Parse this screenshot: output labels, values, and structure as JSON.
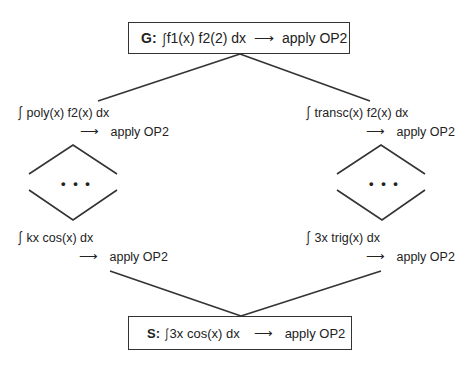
{
  "goal": {
    "prefix": "G:",
    "integral_symbol": "∫",
    "expression": "f1(x) f2(2) dx",
    "arrow": "⟶",
    "action": "apply OP2"
  },
  "left_branch": {
    "top": {
      "integral_symbol": "∫",
      "expression": "poly(x) f2(x) dx",
      "arrow": "⟶",
      "action": "apply OP2"
    },
    "ellipsis": "• • •",
    "bottom": {
      "integral_symbol": "∫",
      "expression": "kx cos(x) dx",
      "arrow": "⟶",
      "action": "apply OP2"
    }
  },
  "right_branch": {
    "top": {
      "integral_symbol": "∫",
      "expression": "transc(x) f2(x) dx",
      "arrow": "⟶",
      "action": "apply OP2"
    },
    "ellipsis": "• • •",
    "bottom": {
      "integral_symbol": "∫",
      "expression": "3x trig(x) dx",
      "arrow": "⟶",
      "action": "apply OP2"
    }
  },
  "solution": {
    "prefix": "S:",
    "integral_symbol": "∫",
    "expression": "3x cos(x) dx",
    "arrow": "⟶",
    "action": "apply OP2"
  },
  "colors": {
    "line": "#333333",
    "text": "#222222",
    "background": "#ffffff"
  }
}
